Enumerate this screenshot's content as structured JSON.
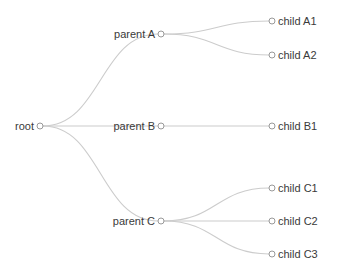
{
  "diagram": {
    "type": "tree",
    "title": "",
    "orientation": "horizontal-left-to-right",
    "background_color": "#ffffff",
    "link_color": "#cccccc",
    "node_stroke_color": "#999999",
    "node_fill_color": "#ffffff",
    "label_color": "#3a3a3a",
    "node_radius": 3
  },
  "nodes": [
    {
      "id": "root",
      "label": "root",
      "x": 40,
      "y": 126,
      "depth": 0,
      "label_side": "left"
    },
    {
      "id": "parentA",
      "label": "parent A",
      "x": 161,
      "y": 34,
      "depth": 1,
      "label_side": "left"
    },
    {
      "id": "parentB",
      "label": "parent B",
      "x": 161,
      "y": 126,
      "depth": 1,
      "label_side": "left"
    },
    {
      "id": "parentC",
      "label": "parent C",
      "x": 161,
      "y": 221,
      "depth": 1,
      "label_side": "left"
    },
    {
      "id": "childA1",
      "label": "child A1",
      "x": 272,
      "y": 21,
      "depth": 2,
      "label_side": "right"
    },
    {
      "id": "childA2",
      "label": "child A2",
      "x": 272,
      "y": 55,
      "depth": 2,
      "label_side": "right"
    },
    {
      "id": "childB1",
      "label": "child B1",
      "x": 272,
      "y": 126,
      "depth": 2,
      "label_side": "right"
    },
    {
      "id": "childC1",
      "label": "child C1",
      "x": 272,
      "y": 188,
      "depth": 2,
      "label_side": "right"
    },
    {
      "id": "childC2",
      "label": "child C2",
      "x": 272,
      "y": 221,
      "depth": 2,
      "label_side": "right"
    },
    {
      "id": "childC3",
      "label": "child C3",
      "x": 272,
      "y": 254,
      "depth": 2,
      "label_side": "right"
    }
  ],
  "links": [
    {
      "source": "root",
      "target": "parentA"
    },
    {
      "source": "root",
      "target": "parentB"
    },
    {
      "source": "root",
      "target": "parentC"
    },
    {
      "source": "parentA",
      "target": "childA1"
    },
    {
      "source": "parentA",
      "target": "childA2"
    },
    {
      "source": "parentB",
      "target": "childB1"
    },
    {
      "source": "parentC",
      "target": "childC1"
    },
    {
      "source": "parentC",
      "target": "childC2"
    },
    {
      "source": "parentC",
      "target": "childC3"
    }
  ]
}
